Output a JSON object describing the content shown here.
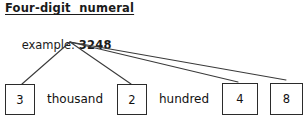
{
  "heading": {
    "text": "Four-digit  numeral"
  },
  "example": {
    "label": "example: ",
    "number": "3248"
  },
  "place_value": {
    "digits": [
      {
        "value": "3",
        "x": 5,
        "y": 84,
        "w": 30,
        "h": 31
      },
      {
        "value": "2",
        "x": 117,
        "y": 84,
        "w": 30,
        "h": 31
      },
      {
        "value": "4",
        "x": 222,
        "y": 83,
        "w": 36,
        "h": 32
      },
      {
        "value": "8",
        "x": 270,
        "y": 83,
        "w": 33,
        "h": 32
      }
    ],
    "words": [
      {
        "text": "thousand",
        "x": 47,
        "y": 92
      },
      {
        "text": "hundred",
        "x": 159,
        "y": 92
      }
    ]
  },
  "connectors": {
    "origin": {
      "x": 70,
      "y": 42
    },
    "stroke": "#3a3a3a",
    "lines": [
      {
        "x2": 22,
        "y2": 84
      },
      {
        "x2": 131,
        "y2": 84
      },
      {
        "x2": 238,
        "y2": 82
      },
      {
        "x2": 286,
        "y2": 80
      }
    ]
  },
  "colors": {
    "background": "#ffffff",
    "ink": "#111111",
    "box_border": "#2b2b2b",
    "line": "#3a3a3a"
  }
}
